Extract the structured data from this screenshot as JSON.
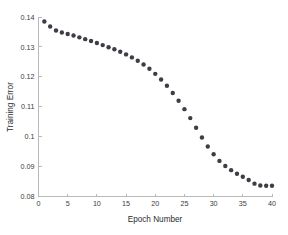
{
  "chart_data": {
    "type": "scatter",
    "title": "",
    "xlabel": "Epoch Number",
    "ylabel": "Training Error",
    "xlim": [
      0,
      40
    ],
    "ylim": [
      0.08,
      0.14
    ],
    "grid": false,
    "legend": null,
    "marker": {
      "shape": "circle",
      "color": "#3d3d45",
      "size": 2.2,
      "filled": true
    },
    "xticks": [
      0,
      5,
      10,
      15,
      20,
      25,
      30,
      35,
      40
    ],
    "xticklabels": [
      "0",
      "5",
      "10",
      "15",
      "20",
      "25",
      "30",
      "35",
      "40"
    ],
    "yticks": [
      0.08,
      0.09,
      0.1,
      0.11,
      0.12,
      0.13,
      0.14
    ],
    "yticklabels": [
      "0.08",
      "0.09",
      "0.1",
      "0.11",
      "0.12",
      "0.13",
      "0.14"
    ],
    "series": [
      {
        "name": "Training Error",
        "x": [
          1,
          2,
          3,
          4,
          5,
          6,
          7,
          8,
          9,
          10,
          11,
          12,
          13,
          14,
          15,
          16,
          17,
          18,
          19,
          20,
          21,
          22,
          23,
          24,
          25,
          26,
          27,
          28,
          29,
          30,
          31,
          32,
          33,
          34,
          35,
          36,
          37,
          38,
          39,
          40
        ],
        "y": [
          0.1385,
          0.1368,
          0.1355,
          0.1348,
          0.1343,
          0.1338,
          0.1332,
          0.1326,
          0.132,
          0.1313,
          0.1306,
          0.1299,
          0.1292,
          0.1284,
          0.1275,
          0.1265,
          0.1254,
          0.1241,
          0.1227,
          0.121,
          0.1191,
          0.117,
          0.1146,
          0.112,
          0.1092,
          0.1062,
          0.103,
          0.0997,
          0.0967,
          0.0941,
          0.0919,
          0.0902,
          0.0888,
          0.0876,
          0.0866,
          0.0855,
          0.0843,
          0.0837,
          0.0836,
          0.0836
        ]
      }
    ]
  },
  "axes": {
    "x_title": "Epoch Number",
    "y_title": "Training Error"
  }
}
